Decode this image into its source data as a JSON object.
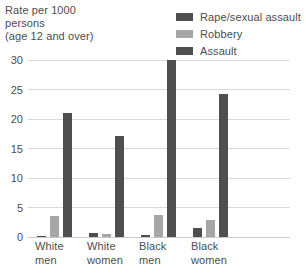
{
  "title": {
    "lines": [
      "Rate per 1000",
      "persons",
      "(age 12 and over)"
    ]
  },
  "legend": {
    "position": "top-right",
    "items": [
      {
        "label": "Rape/sexual assault",
        "color": "#4f4f4f"
      },
      {
        "label": "Robbery",
        "color": "#a6a6a6"
      },
      {
        "label": "Assault",
        "color": "#4f4f4f"
      }
    ]
  },
  "axis": {
    "y_ticks": [
      "0",
      "5",
      "10",
      "15",
      "20",
      "25",
      "30"
    ],
    "x_categories": [
      {
        "lines": [
          "White",
          "men"
        ]
      },
      {
        "lines": [
          "White",
          "women"
        ]
      },
      {
        "lines": [
          "Black",
          "men"
        ]
      },
      {
        "lines": [
          "Black",
          "women"
        ]
      }
    ]
  },
  "colors": {
    "dark": "#4f4f4f",
    "light": "#a6a6a6",
    "grid": "#d9d9d9",
    "text": "#4d4d4d",
    "background": "#ffffff"
  },
  "chart_data": {
    "type": "bar",
    "title": "Rate per 1000 persons (age 12 and over)",
    "xlabel": "",
    "ylabel": "Rate per 1000 persons (age 12 and over)",
    "ylim": [
      0,
      30
    ],
    "yticks": [
      0,
      5,
      10,
      15,
      20,
      25,
      30
    ],
    "grid": true,
    "legend_position": "top-right",
    "categories": [
      "White men",
      "White women",
      "Black men",
      "Black women"
    ],
    "series": [
      {
        "name": "Rape/sexual assault",
        "color": "#4f4f4f",
        "values": [
          0.2,
          0.6,
          0.3,
          1.6
        ]
      },
      {
        "name": "Robbery",
        "color": "#a6a6a6",
        "values": [
          3.5,
          0.5,
          3.7,
          2.9
        ]
      },
      {
        "name": "Assault",
        "color": "#4f4f4f",
        "values": [
          21.0,
          17.2,
          30.0,
          24.3
        ]
      }
    ]
  }
}
